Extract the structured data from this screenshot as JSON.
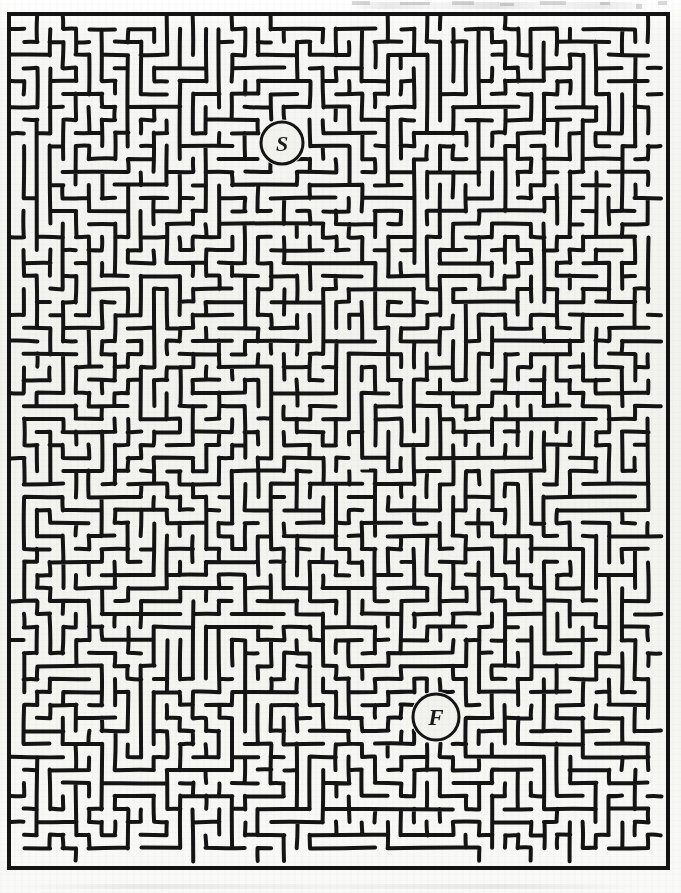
{
  "document": {
    "type": "maze-puzzle",
    "title": "Maze",
    "page_width": 681,
    "page_height": 893,
    "paper_color": "#f2f2ef",
    "ink_color": "#141414",
    "style": "hand-drawn scanned maze, dense organic passages"
  },
  "maze": {
    "border": {
      "x": 9,
      "y": 14,
      "width": 659,
      "height": 854,
      "stroke_width": 4,
      "color": "#141414"
    },
    "grid": {
      "cell_size": 13,
      "cols": 50,
      "rows": 65,
      "wall_thickness": 4,
      "corner_radius": 5,
      "seed": 20240617
    },
    "markers": [
      {
        "id": "start",
        "label": "S",
        "name": "start-marker",
        "cx": 282,
        "cy": 143,
        "r": 21,
        "stroke_width": 3,
        "font_size": 22
      },
      {
        "id": "finish",
        "label": "F",
        "name": "finish-marker",
        "cx": 436,
        "cy": 717,
        "r": 23,
        "stroke_width": 3,
        "font_size": 23
      }
    ],
    "center_mark": {
      "id": "center-cross",
      "label": "+",
      "cx": 356,
      "cy": 466,
      "arm": 13,
      "thickness": 7
    }
  },
  "legend": {
    "start_text": "S",
    "finish_text": "F",
    "start_meaning": "Start",
    "finish_meaning": "Finish"
  },
  "artifacts": {
    "top_marks": [
      {
        "left": 352,
        "top": 1,
        "width": 18,
        "height": 4
      },
      {
        "left": 400,
        "top": 2,
        "width": 30,
        "height": 3
      },
      {
        "left": 452,
        "top": 1,
        "width": 22,
        "height": 4
      },
      {
        "left": 500,
        "top": 3,
        "width": 14,
        "height": 3
      },
      {
        "left": 540,
        "top": 1,
        "width": 26,
        "height": 4
      },
      {
        "left": 600,
        "top": 2,
        "width": 10,
        "height": 3
      },
      {
        "left": 636,
        "top": 4,
        "width": 6,
        "height": 5
      },
      {
        "left": 658,
        "top": 1,
        "width": 9,
        "height": 4
      }
    ]
  }
}
